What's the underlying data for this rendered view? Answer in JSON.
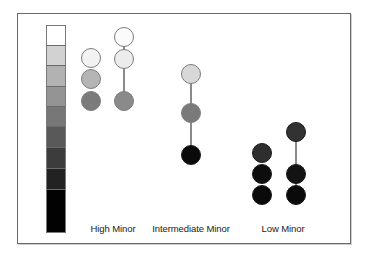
{
  "diagram": {
    "type": "grayscale-intensity-scale-with-chord-circles",
    "scale_bar": {
      "segments": [
        {
          "color": "#ffffff",
          "height": 20
        },
        {
          "color": "#d2d2d2",
          "height": 20
        },
        {
          "color": "#b2b2b2",
          "height": 21
        },
        {
          "color": "#949494",
          "height": 20
        },
        {
          "color": "#777777",
          "height": 20
        },
        {
          "color": "#595959",
          "height": 21
        },
        {
          "color": "#3c3c3c",
          "height": 21
        },
        {
          "color": "#222222",
          "height": 21
        },
        {
          "color": "#020202",
          "height": 42
        }
      ]
    },
    "groups": [
      {
        "label": "High Minor",
        "label_x": 113,
        "columns": [
          {
            "x": 91,
            "connected": false,
            "circles": [
              {
                "y": 58,
                "color": "#f2f2f2"
              },
              {
                "y": 79,
                "color": "#b5b5b5"
              },
              {
                "y": 101,
                "color": "#7b7b7b"
              }
            ]
          },
          {
            "x": 124,
            "connected": true,
            "circles": [
              {
                "y": 37,
                "color": "#fbfbfb"
              },
              {
                "y": 59,
                "color": "#ececec"
              },
              {
                "y": 101,
                "color": "#8a8a8a"
              }
            ]
          }
        ]
      },
      {
        "label": "Intermediate Minor",
        "label_x": 191,
        "columns": [
          {
            "x": 191,
            "connected": true,
            "circles": [
              {
                "y": 74,
                "color": "#d8d8d8"
              },
              {
                "y": 113,
                "color": "#7a7a7a"
              },
              {
                "y": 155,
                "color": "#0a0a0a"
              }
            ]
          }
        ]
      },
      {
        "label": "Low Minor",
        "label_x": 283,
        "columns": [
          {
            "x": 262,
            "connected": false,
            "circles": [
              {
                "y": 153,
                "color": "#2e2e2e"
              },
              {
                "y": 174,
                "color": "#0d0d0d"
              },
              {
                "y": 195,
                "color": "#0a0a0a"
              }
            ]
          },
          {
            "x": 296,
            "connected": true,
            "circles": [
              {
                "y": 132,
                "color": "#323232"
              },
              {
                "y": 174,
                "color": "#131313"
              },
              {
                "y": 195,
                "color": "#0a0a0a"
              }
            ]
          }
        ]
      }
    ]
  },
  "labels": {
    "high_minor": "High Minor",
    "intermediate_minor": "Intermediate Minor",
    "low_minor": "Low Minor"
  }
}
